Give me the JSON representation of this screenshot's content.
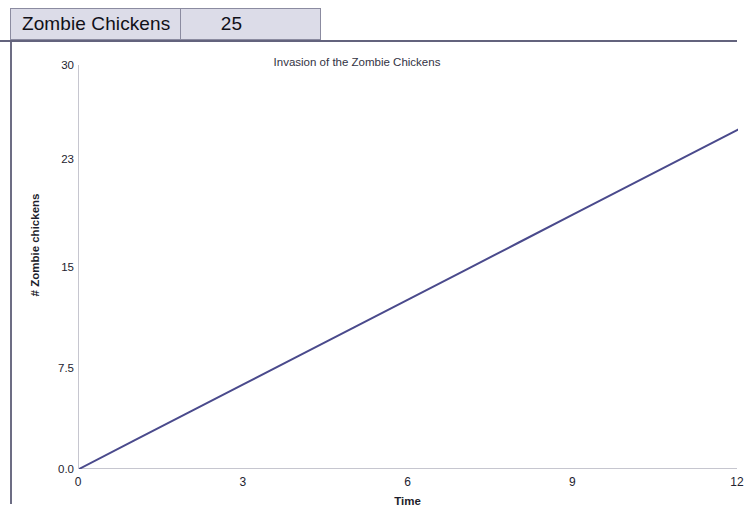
{
  "header": {
    "name_label": "Zombie Chickens",
    "value_label": "25"
  },
  "chart_data": {
    "type": "line",
    "title": "Invasion of the Zombie Chickens",
    "xlabel": "Time",
    "ylabel": "# Zombie chickens",
    "xlim": [
      0,
      12
    ],
    "ylim": [
      0,
      30
    ],
    "grid": false,
    "legend": false,
    "line_color": "#4a4a8c",
    "line_width": 2,
    "xticks": [
      "0",
      "3",
      "6",
      "9",
      "12"
    ],
    "xtick_values": [
      0,
      3,
      6,
      9,
      12
    ],
    "yticks": [
      "0.0",
      "7.5",
      "15",
      "23",
      "30"
    ],
    "ytick_values": [
      0,
      7.5,
      15,
      23,
      30
    ],
    "series": [
      {
        "name": "Zombie chickens",
        "x": [
          0,
          1,
          2,
          3,
          4,
          5,
          6,
          7,
          8,
          9,
          10,
          11,
          12
        ],
        "values": [
          0,
          2.1,
          4.2,
          6.3,
          8.4,
          10.5,
          12.6,
          14.7,
          16.8,
          18.9,
          21.0,
          23.1,
          25.2
        ]
      }
    ]
  }
}
